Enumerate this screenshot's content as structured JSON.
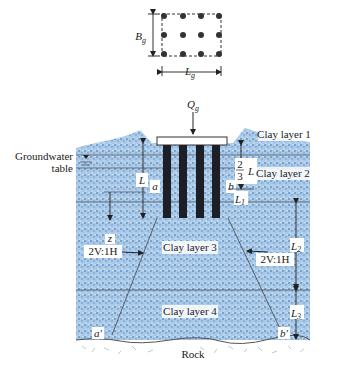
{
  "plan_view": {
    "width_label": "B",
    "width_sub": "g",
    "length_label": "L",
    "length_sub": "g",
    "pile_rows": 3,
    "pile_cols": 4
  },
  "section": {
    "load_label": "Q",
    "load_sub": "g",
    "groundwater_label_line1": "Groundwater",
    "groundwater_label_line2": "table",
    "layers": [
      "Clay layer 1",
      "Clay layer 2",
      "Clay layer 3",
      "Clay layer 4"
    ],
    "rock_label": "Rock",
    "pile_length_label": "L",
    "two_thirds_num": "2",
    "two_thirds_den": "3",
    "two_thirds_L": "L",
    "L1": "L",
    "L1_sub": "1",
    "L2": "L",
    "L2_sub": "2",
    "L3": "L",
    "L3_sub": "3",
    "point_a": "a",
    "point_b": "b",
    "point_a_prime": "a'",
    "point_b_prime": "b'",
    "depth_z": "z",
    "slope_left": "2V:1H",
    "slope_right": "2V:1H"
  },
  "colors": {
    "soil": "#a9c9e8",
    "soil_dot": "#3d6fa8",
    "pile": "#1e1e26",
    "line": "#333333",
    "rock": "#ffffff"
  }
}
